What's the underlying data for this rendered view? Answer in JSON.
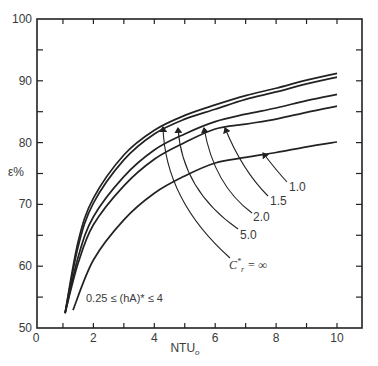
{
  "chart_data": {
    "type": "line",
    "title": "",
    "xlabel": "NTU",
    "xlabel_subscript": "o",
    "ylabel": "ε%",
    "xlim": [
      0,
      10
    ],
    "ylim": [
      50,
      100
    ],
    "x_ticks": [
      0,
      2,
      4,
      6,
      8,
      10
    ],
    "x_minor_ticks": [
      1,
      3,
      5,
      7,
      9
    ],
    "y_ticks": [
      50,
      60,
      70,
      80,
      90,
      100
    ],
    "y_minor_ticks": [
      55,
      65,
      75,
      85,
      95
    ],
    "grid": false,
    "legend": "inline labels with arrows",
    "annotation": "0.25 ≤ (hA)* ≤ 4",
    "series": [
      {
        "name": "C*r = ∞",
        "label": "C*r = ∞",
        "x": [
          1.07,
          1.5,
          2,
          3,
          4,
          5,
          6,
          7,
          8,
          9,
          10
        ],
        "y": [
          52.4,
          64.0,
          71.0,
          78.0,
          82.0,
          84.4,
          86.1,
          87.6,
          88.8,
          90.1,
          91.2
        ]
      },
      {
        "name": "5.0",
        "label": "5.0",
        "x": [
          1.07,
          1.5,
          2,
          3,
          4,
          5,
          6,
          7,
          8,
          9,
          10
        ],
        "y": [
          52.4,
          63.2,
          70.2,
          77.2,
          81.4,
          83.8,
          85.4,
          87.0,
          88.2,
          89.5,
          90.6
        ]
      },
      {
        "name": "2.0",
        "label": "2.0",
        "x": [
          1.07,
          1.5,
          2,
          3,
          4,
          5,
          6,
          7,
          8,
          9,
          10
        ],
        "y": [
          52.4,
          61.5,
          68.0,
          74.5,
          78.8,
          81.4,
          83.4,
          84.6,
          85.6,
          86.8,
          87.8
        ]
      },
      {
        "name": "1.5",
        "label": "1.5",
        "x": [
          1.07,
          1.5,
          2,
          3,
          4,
          5,
          6,
          7,
          8,
          9,
          10
        ],
        "y": [
          52.4,
          60.5,
          66.7,
          73.0,
          77.3,
          80.0,
          82.2,
          83.0,
          83.8,
          84.9,
          85.9
        ]
      },
      {
        "name": "1.0",
        "label": "1.0",
        "x": [
          1.33,
          2,
          3,
          4,
          5,
          6,
          7,
          8,
          9,
          10
        ],
        "y": [
          52.9,
          61.0,
          67.5,
          71.8,
          74.6,
          76.7,
          77.6,
          78.4,
          79.3,
          80.1
        ]
      }
    ]
  },
  "labels": {
    "y_axis_symbol": "ε%",
    "x_axis_main": "NTU",
    "x_axis_sub": "o",
    "annotation_text": "0.25 ≤ (hA)* ≤ 4",
    "curve_labels": [
      "C*r = ∞",
      "5.0",
      "2.0",
      "1.5",
      "1.0"
    ]
  }
}
